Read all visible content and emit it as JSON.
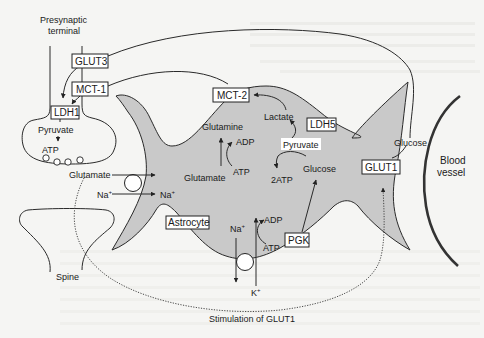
{
  "figure": {
    "colors": {
      "astrocyte_fill": "#c9c9c9",
      "background": "#f5f5f3",
      "stroke": "#2a2a2a",
      "box_fill": "#ffffff"
    }
  },
  "neuron": {
    "presynaptic_label_line1": "Presynaptic",
    "presynaptic_label_line2": "terminal",
    "glut3": "GLUT3",
    "mct1": "MCT-1",
    "ldh1": "LDH1",
    "pyruvate": "Pyruvate",
    "atp": "ATP",
    "spine": "Spine"
  },
  "synapse": {
    "glutamate": "Glutamate",
    "na_in": "Na",
    "na_out": "Na",
    "plus": "+"
  },
  "astrocyte": {
    "label": "Astrocyte",
    "mct2": "MCT-2",
    "lactate": "Lactate",
    "ldh5": "LDH5",
    "pyruvate": "Pyruvate",
    "glucose": "Glucose",
    "two_atp": "2ATP",
    "glutamine": "Glutamine",
    "adp_top": "ADP",
    "atp_top": "ATP",
    "glutamate": "Glutamate",
    "na": "Na",
    "k": "K",
    "plus": "+",
    "adp_bottom": "ADP",
    "atp_bottom": "ATP",
    "pgk": "PGK",
    "glut1": "GLUT1"
  },
  "vessel": {
    "glucose": "Glucose",
    "label_line1": "Blood",
    "label_line2": "vessel"
  },
  "footer": {
    "stimulation": "Stimulation of GLUT1"
  }
}
